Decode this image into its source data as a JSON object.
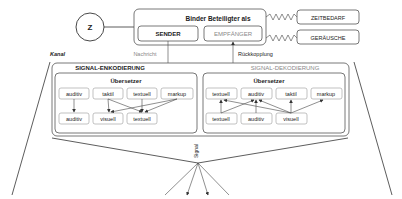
{
  "top": {
    "z_label": "Z",
    "participant_title": "Binder Beteiligter als",
    "sender": "SENDER",
    "receiver": "EMPFÄNGER",
    "time_demand": "ZEITBEDARF",
    "noise": "GERÄUSCHE",
    "message_label": "Nachricht",
    "feedback_label": "Rückkopplung"
  },
  "channel": {
    "label": "Kanal",
    "signal_label": "Signal"
  },
  "encoding": {
    "title": "SIGNAL-ENKODIERUNG",
    "translator": "Übersetzer",
    "inputs": [
      "auditiv",
      "taktil",
      "textuell",
      "markup"
    ],
    "outputs": [
      "auditiv",
      "visuell",
      "textuell"
    ]
  },
  "decoding": {
    "title": "SIGNAL-DEKODIERUNG",
    "translator": "Übersetzer",
    "outputs": [
      "textuell",
      "auditiv",
      "taktil",
      "markup"
    ],
    "inputs": [
      "textuell",
      "auditiv",
      "visuell"
    ]
  }
}
